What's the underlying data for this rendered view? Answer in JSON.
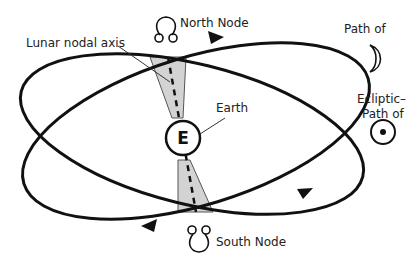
{
  "diagram": {
    "labels": {
      "north_node": "North Node",
      "south_node": "South Node",
      "lunar_nodal_axis": "Lunar nodal axis",
      "earth": "Earth",
      "earth_symbol": "E",
      "moon_path": "Path of",
      "ecliptic_line1": "Ecliptic–",
      "ecliptic_line2": "Path of"
    },
    "icons": {
      "north_node": "north-node-symbol",
      "south_node": "south-node-symbol",
      "moon": "crescent-moon-symbol",
      "sun": "sun-symbol"
    },
    "colors": {
      "line": "#111111",
      "shadow_band": "#d3d3d3",
      "text": "#222222",
      "background": "#ffffff"
    }
  }
}
